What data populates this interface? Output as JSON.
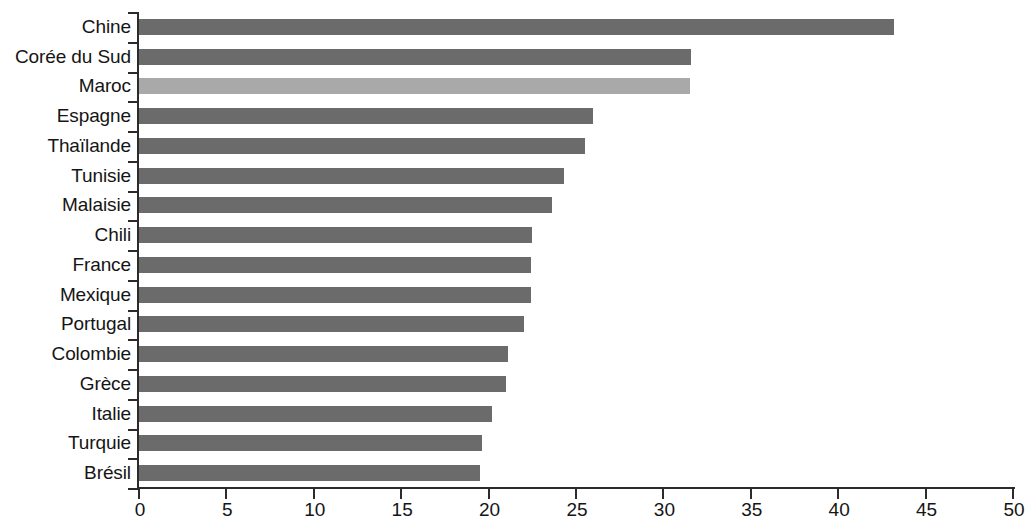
{
  "chart_data": {
    "type": "bar",
    "orientation": "horizontal",
    "title": "",
    "subtitle": "",
    "xlabel": "",
    "ylabel": "",
    "xlim": [
      0,
      50
    ],
    "xticks": [
      0,
      5,
      10,
      15,
      20,
      25,
      30,
      35,
      40,
      45,
      50
    ],
    "grid": false,
    "legend": null,
    "categories": [
      "Chine",
      "Corée du Sud",
      "Maroc",
      "Espagne",
      "Thaïlande",
      "Tunisie",
      "Malaisie",
      "Chili",
      "France",
      "Mexique",
      "Portugal",
      "Colombie",
      "Grèce",
      "Italie",
      "Turquie",
      "Brésil"
    ],
    "values": [
      43.2,
      31.6,
      31.5,
      26.0,
      25.5,
      24.3,
      23.6,
      22.5,
      22.4,
      22.4,
      22.0,
      21.1,
      21.0,
      20.2,
      19.6,
      19.5
    ],
    "highlight_category": "Maroc",
    "colors": {
      "bar": "#6b6b6b",
      "bar_highlight": "#a9a9a9",
      "axis": "#2b2b2b",
      "text": "#151515",
      "background": "#ffffff"
    }
  }
}
